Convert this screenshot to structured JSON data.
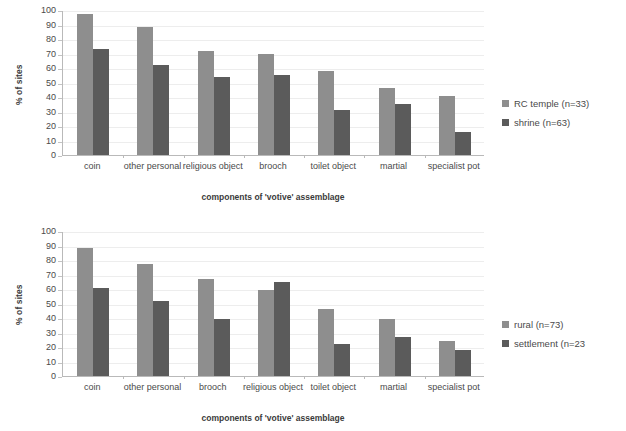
{
  "figure": {
    "background": "#ffffff",
    "series_colors": {
      "light": "#8e8e8e",
      "dark": "#5b5b5b"
    }
  },
  "charts": [
    {
      "id": "chart-top",
      "ylabel": "% of sites",
      "xlabel": "components of 'votive' assemblage",
      "yticks": [
        "0",
        "10",
        "20",
        "30",
        "40",
        "50",
        "60",
        "70",
        "80",
        "90",
        "100"
      ],
      "legend": [
        {
          "label": "RC temple (n=33)",
          "swatch": "light"
        },
        {
          "label": "shrine (n=63)",
          "swatch": "dark"
        }
      ],
      "categories": [
        "coin",
        "other personal",
        "religious object",
        "brooch",
        "toilet object",
        "martial",
        "specialist pot"
      ]
    },
    {
      "id": "chart-bottom",
      "ylabel": "% of sites",
      "xlabel": "components of 'votive' assemblage",
      "yticks": [
        "0",
        "10",
        "20",
        "30",
        "40",
        "50",
        "60",
        "70",
        "80",
        "90",
        "100"
      ],
      "legend": [
        {
          "label": "rural (n=73)",
          "swatch": "light"
        },
        {
          "label": "settlement (n=23",
          "swatch": "dark"
        }
      ],
      "categories": [
        "coin",
        "other personal",
        "brooch",
        "religious object",
        "toilet object",
        "martial",
        "specialist pot"
      ]
    }
  ],
  "chart_data": [
    {
      "type": "bar",
      "title": "",
      "xlabel": "components of 'votive' assemblage",
      "ylabel": "% of sites",
      "ylim": [
        0,
        100
      ],
      "ytick_step": 10,
      "grid": true,
      "legend_position": "right",
      "categories": [
        "coin",
        "other personal",
        "religious object",
        "brooch",
        "toilet object",
        "martial",
        "specialist pot"
      ],
      "series": [
        {
          "name": "RC temple (n=33)",
          "color": "#8e8e8e",
          "values": [
            97,
            88,
            72,
            70,
            58,
            46,
            41
          ]
        },
        {
          "name": "shrine (n=63)",
          "color": "#5b5b5b",
          "values": [
            73,
            62,
            54,
            55,
            31,
            35,
            16
          ]
        }
      ]
    },
    {
      "type": "bar",
      "title": "",
      "xlabel": "components of 'votive' assemblage",
      "ylabel": "% of sites",
      "ylim": [
        0,
        100
      ],
      "ytick_step": 10,
      "grid": true,
      "legend_position": "right",
      "categories": [
        "coin",
        "other personal",
        "brooch",
        "religious object",
        "toilet object",
        "martial",
        "specialist pot"
      ],
      "series": [
        {
          "name": "rural (n=73)",
          "color": "#8e8e8e",
          "values": [
            88,
            77,
            67,
            59,
            46,
            39,
            24
          ]
        },
        {
          "name": "settlement (n=23",
          "color": "#5b5b5b",
          "values": [
            61,
            52,
            39,
            65,
            22,
            27,
            18
          ]
        }
      ]
    }
  ]
}
